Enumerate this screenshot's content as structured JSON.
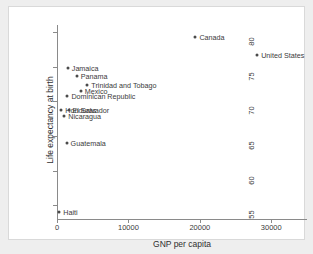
{
  "chart_data": {
    "type": "scatter",
    "title": "",
    "xlabel": "GNP per capita",
    "ylabel": "Life expectancy at birth",
    "xlim": [
      0,
      35000
    ],
    "ylim": [
      53,
      81
    ],
    "xticks": [
      0,
      10000,
      20000,
      30000
    ],
    "xtick_labels": [
      "0",
      "10000",
      "20000",
      "30000"
    ],
    "yticks": [
      55,
      60,
      65,
      70,
      75,
      80
    ],
    "ytick_labels": [
      "55",
      "60",
      "65",
      "70",
      "75",
      "80"
    ],
    "grid": false,
    "legend": "none",
    "marker_color": "#4a4a4a",
    "axis_color": "#8a8a8a",
    "points": [
      {
        "label": "Canada",
        "x": 19380,
        "y": 79.2
      },
      {
        "label": "United States",
        "x": 28020,
        "y": 76.7
      },
      {
        "label": "Jamaica",
        "x": 1510,
        "y": 74.8
      },
      {
        "label": "Panama",
        "x": 2750,
        "y": 73.6
      },
      {
        "label": "Trinidad and Tobago",
        "x": 4250,
        "y": 72.3
      },
      {
        "label": "Mexico",
        "x": 3320,
        "y": 71.5
      },
      {
        "label": "Dominican Republic",
        "x": 1460,
        "y": 70.7
      },
      {
        "label": "Honduras",
        "x": 600,
        "y": 68.8
      },
      {
        "label": "El Salvador",
        "x": 1610,
        "y": 68.8
      },
      {
        "label": "Nicaragua",
        "x": 1020,
        "y": 67.9
      },
      {
        "label": "Guatemala",
        "x": 1340,
        "y": 63.9
      },
      {
        "label": "Haiti",
        "x": 310,
        "y": 54.0
      }
    ]
  }
}
